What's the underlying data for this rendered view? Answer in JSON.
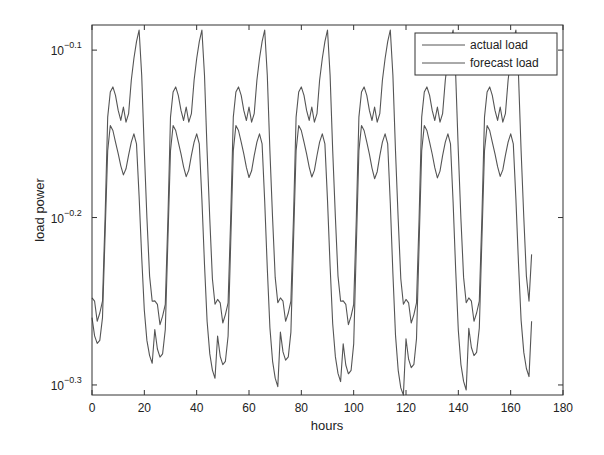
{
  "chart_data": {
    "type": "line",
    "title": "",
    "xlabel": "hours",
    "ylabel": "load power",
    "xlim": [
      0,
      180
    ],
    "ylim_exponent": [
      -0.306,
      -0.085
    ],
    "yscale": "log10",
    "x_ticks": [
      0,
      20,
      40,
      60,
      80,
      100,
      120,
      140,
      160,
      180
    ],
    "y_ticks": [
      {
        "exponent": -0.1,
        "label_base": "10",
        "label_exp": "−0.1"
      },
      {
        "exponent": -0.2,
        "label_base": "10",
        "label_exp": "−0.2"
      },
      {
        "exponent": -0.3,
        "label_base": "10",
        "label_exp": "−0.3"
      }
    ],
    "grid": false,
    "legend_position": "upper right",
    "line_color": "#555555",
    "series": [
      {
        "name": "actual load",
        "x_start": 0,
        "x_step": 1,
        "daily_profile_exponent": [
          -0.248,
          -0.25,
          -0.262,
          -0.257,
          -0.25,
          -0.2,
          -0.14,
          -0.125,
          -0.122,
          -0.127,
          -0.136,
          -0.142,
          -0.134,
          -0.143,
          -0.138,
          -0.118,
          -0.105,
          -0.095,
          -0.088,
          -0.115,
          -0.16,
          -0.2,
          -0.235,
          -0.25
        ],
        "day_minima_exponent": [
          -0.262,
          -0.264,
          -0.263,
          -0.262,
          -0.264,
          -0.263,
          -0.262
        ],
        "end_value_exponent": -0.222
      },
      {
        "name": "forecast load",
        "x_start": 0,
        "x_step": 1,
        "daily_profile_exponent": [
          -0.27,
          -0.282,
          -0.287,
          -0.285,
          -0.27,
          -0.215,
          -0.16,
          -0.145,
          -0.148,
          -0.155,
          -0.162,
          -0.17,
          -0.176,
          -0.172,
          -0.163,
          -0.155,
          -0.15,
          -0.156,
          -0.19,
          -0.23,
          -0.265,
          -0.285,
          -0.295,
          -0.3
        ],
        "day_minima_exponent": [
          -0.287,
          -0.296,
          -0.301,
          -0.298,
          -0.307,
          -0.303,
          -0.295
        ],
        "end_value_exponent": -0.262
      }
    ],
    "cycle_peaks_x": [
      21,
      45,
      68,
      93,
      116,
      141,
      164
    ],
    "x_end": 168
  },
  "axes": {
    "x_tick_labels": [
      "0",
      "20",
      "40",
      "60",
      "80",
      "100",
      "120",
      "140",
      "160",
      "180"
    ]
  },
  "legend": {
    "items": [
      {
        "label": "actual load"
      },
      {
        "label": "forecast load"
      }
    ]
  }
}
